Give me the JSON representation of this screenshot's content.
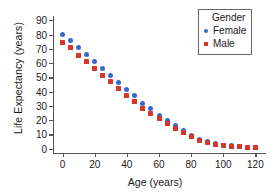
{
  "chart_data": {
    "type": "scatter",
    "title": "",
    "xlabel": "Age (years)",
    "ylabel": "Life Expectancy (years)",
    "xlim": [
      -6,
      126
    ],
    "ylim": [
      -3,
      93
    ],
    "xticks": [
      0,
      20,
      40,
      60,
      80,
      100,
      120
    ],
    "yticks": [
      0,
      10,
      20,
      30,
      40,
      50,
      60,
      70,
      80,
      90
    ],
    "grid": false,
    "legend_position": "top-right",
    "legend_title": "Gender",
    "x": [
      0,
      5,
      10,
      15,
      20,
      25,
      30,
      35,
      40,
      45,
      50,
      55,
      60,
      65,
      70,
      75,
      80,
      85,
      90,
      95,
      100,
      105,
      110,
      115,
      120
    ],
    "series": [
      {
        "name": "Female",
        "marker": "circle",
        "color": "#3b67c4",
        "values": [
          80,
          76,
          71,
          66,
          61,
          56,
          51.5,
          46.5,
          41.5,
          37,
          32,
          28,
          23.5,
          19.5,
          16,
          12.5,
          9.5,
          6.5,
          5,
          3.5,
          2.5,
          2,
          1.5,
          1.2,
          1
        ]
      },
      {
        "name": "Male",
        "marker": "square",
        "color": "#d6352b",
        "values": [
          74.5,
          71,
          65.5,
          61,
          56,
          51.5,
          47,
          42,
          37.5,
          33,
          28.5,
          24.5,
          21,
          17.5,
          14.5,
          11.5,
          8.5,
          6,
          4.5,
          3.2,
          2.3,
          1.8,
          1.4,
          1.1,
          0.9
        ]
      }
    ]
  },
  "colors": {
    "female": "#3b67c4",
    "male": "#d6352b",
    "axis": "#555555",
    "text": "#1a1a1a",
    "background": "#ffffff"
  }
}
